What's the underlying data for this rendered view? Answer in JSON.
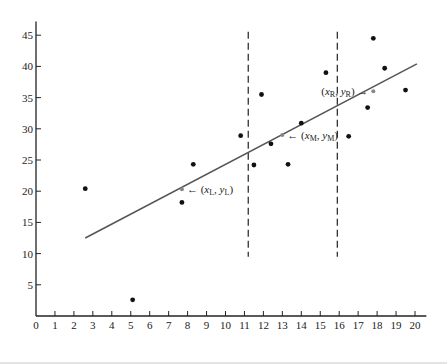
{
  "chart_data": {
    "type": "scatter",
    "title": "",
    "xlabel": "",
    "ylabel": "",
    "xlim": [
      0,
      20.5
    ],
    "ylim": [
      0,
      47
    ],
    "grid": false,
    "legend": null,
    "x_ticks": [
      0,
      1,
      2,
      3,
      4,
      5,
      6,
      7,
      8,
      9,
      10,
      11,
      12,
      13,
      14,
      15,
      16,
      17,
      18,
      19,
      20
    ],
    "y_ticks": [
      5,
      10,
      15,
      20,
      25,
      30,
      35,
      40,
      45
    ],
    "x_tick_labels": [
      "0",
      "1",
      "2",
      "3",
      "4",
      "5",
      "6",
      "7",
      "8",
      "9",
      "10",
      "11",
      "12",
      "13",
      "14",
      "15",
      "16",
      "17",
      "18",
      "19",
      "20"
    ],
    "y_tick_labels": [
      "5",
      "10",
      "15",
      "20",
      "25",
      "30",
      "35",
      "40",
      "45"
    ],
    "series": [
      {
        "name": "data points",
        "x": [
          2.6,
          5.1,
          7.7,
          8.3,
          10.8,
          11.5,
          11.9,
          12.4,
          13.3,
          14.0,
          15.3,
          16.5,
          17.5,
          17.8,
          18.4,
          19.5
        ],
        "y": [
          20.4,
          2.6,
          18.2,
          24.3,
          28.9,
          24.2,
          35.5,
          27.6,
          24.3,
          30.9,
          39.0,
          28.8,
          33.4,
          44.5,
          39.7,
          36.2
        ]
      }
    ],
    "fit_line": {
      "x_start": 2.6,
      "y_start": 12.5,
      "x_end": 20.1,
      "y_end": 40.4
    },
    "vertical_dashed_lines": [
      {
        "x": 11.2,
        "y_from": 9.5,
        "y_to": 47
      },
      {
        "x": 15.9,
        "y_from": 9.5,
        "y_to": 47
      }
    ],
    "annotations": [
      {
        "text": "← (x_L, y_L)",
        "point": [
          7.7,
          20.3
        ],
        "main": "x",
        "sub": "L",
        "main2": "y",
        "sub2": "L",
        "arrow_side": "left"
      },
      {
        "text": "← (x_M, y_M)",
        "point": [
          13.0,
          29.0
        ],
        "main": "x",
        "sub": "M",
        "main2": "y",
        "sub2": "M",
        "arrow_side": "left"
      },
      {
        "text": "(x_R, y_R) →",
        "point": [
          17.8,
          36.0
        ],
        "main": "x",
        "sub": "R",
        "main2": "y",
        "sub2": "R",
        "arrow_side": "right"
      }
    ]
  }
}
